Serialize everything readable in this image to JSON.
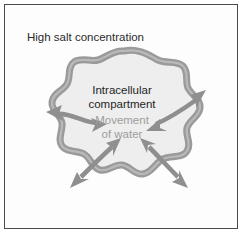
{
  "figure": {
    "type": "biology-diagram",
    "frame": {
      "border_color": "#4a4a4a",
      "background_color": "#ffffff"
    }
  },
  "labels": {
    "external_environment": "High salt concentration",
    "compartment_line1": "Intracellular",
    "compartment_line2": "compartment",
    "water_line1": "Movement",
    "water_line2": "of water"
  },
  "colors": {
    "membrane": "#9a9a9a",
    "membrane_shadow": "#b4b4b4",
    "cytoplasm": "#eeeeee",
    "arrow": "#8f8f8f",
    "arrow_outline": "#6f6f6f",
    "text_dark": "#1f1f1f",
    "text_gray": "#9d9d9d"
  },
  "cell": {
    "name": "intracellular-compartment",
    "shape": "amoeboid-wavy-blob",
    "center_x": 124,
    "center_y": 120,
    "membrane_thickness_px": 7
  },
  "arrows": [
    {
      "name": "water-arrow-upper-left",
      "direction": "bidirectional",
      "heads": 2,
      "angle_deg": 195,
      "crosses_membrane": true
    },
    {
      "name": "water-arrow-upper-right",
      "direction": "bidirectional",
      "heads": 2,
      "angle_deg": 325,
      "crosses_membrane": true
    },
    {
      "name": "water-arrow-lower-left",
      "direction": "bidirectional",
      "heads": 2,
      "angle_deg": 225,
      "crosses_membrane": true
    },
    {
      "name": "water-arrow-lower-right",
      "direction": "bidirectional",
      "heads": 2,
      "angle_deg": 315,
      "crosses_membrane": true
    }
  ]
}
